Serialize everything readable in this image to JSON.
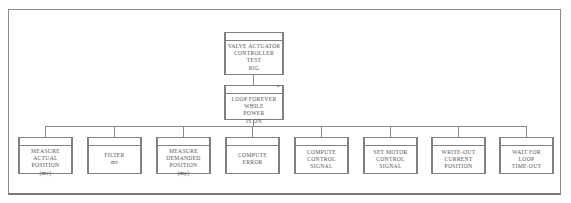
{
  "diagram": {
    "type": "jackson-structure-diagram",
    "root": {
      "lines": [
        "VALVE ACTUATOR",
        "CONTROLLER",
        "TEST",
        "RIG"
      ]
    },
    "loop": {
      "marker": "*",
      "lines": [
        "LOOP FOREVER",
        "WHILE",
        "POWER",
        "IS ON"
      ]
    },
    "children": [
      {
        "lines": [
          "MEASURE",
          "ACTUAL",
          "POSITION",
          "(mv)"
        ]
      },
      {
        "lines": [
          "FILTER",
          "mv"
        ]
      },
      {
        "lines": [
          "MEASURE",
          "DEMANDED",
          "POSITION",
          "(mp)"
        ]
      },
      {
        "lines": [
          "COMPUTE",
          "ERROR"
        ]
      },
      {
        "lines": [
          "COMPUTE",
          "CONTROL",
          "SIGNAL"
        ]
      },
      {
        "lines": [
          "SET MOTOR",
          "CONTROL",
          "SIGNAL"
        ]
      },
      {
        "lines": [
          "WRITE-OUT",
          "CURRENT",
          "POSITION"
        ]
      },
      {
        "lines": [
          "WAIT FOR",
          "LOOP",
          "TIME-OUT"
        ]
      }
    ]
  },
  "colors": {
    "line": "#8a8a8a",
    "text": "#555555",
    "background": "#ffffff"
  }
}
